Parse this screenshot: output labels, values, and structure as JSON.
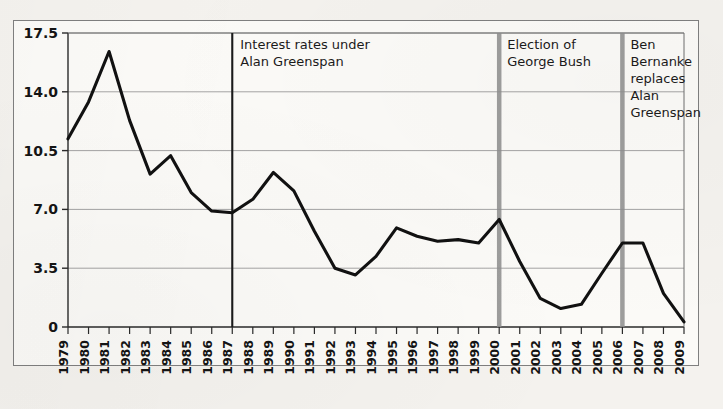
{
  "figure": {
    "background_color": "#fbfaf7",
    "page_color": "#f4f2ee",
    "frame_color": "#7f7f7f"
  },
  "chart_data": {
    "type": "line",
    "title": "",
    "subtitle": "",
    "xlabel": "",
    "ylabel": "",
    "xlim": [
      1979,
      2009
    ],
    "ylim": [
      0,
      17.5
    ],
    "grid": true,
    "legend_position": "none",
    "line_color": "#111111",
    "y_ticks": [
      0,
      3.5,
      7.0,
      10.5,
      14.0,
      17.5
    ],
    "y_tick_labels": [
      "0",
      "3.5",
      "7.0",
      "10.5",
      "14.0",
      "17.5"
    ],
    "categories": [
      "1979",
      "1980",
      "1981",
      "1982",
      "1983",
      "1984",
      "1985",
      "1986",
      "1987",
      "1988",
      "1989",
      "1990",
      "1991",
      "1992",
      "1993",
      "1994",
      "1995",
      "1996",
      "1997",
      "1998",
      "1999",
      "2000",
      "2001",
      "2002",
      "2003",
      "2004",
      "2005",
      "2006",
      "2007",
      "2008",
      "2009"
    ],
    "series": [
      {
        "name": "Interest rate",
        "values": [
          11.2,
          13.4,
          16.4,
          12.3,
          9.1,
          10.2,
          8.0,
          6.9,
          6.8,
          7.6,
          9.2,
          8.1,
          5.7,
          3.5,
          3.1,
          4.2,
          5.9,
          5.4,
          5.1,
          5.2,
          5.0,
          6.4,
          3.9,
          1.7,
          1.1,
          1.35,
          3.2,
          5.0,
          5.0,
          2.0,
          0.3
        ]
      }
    ],
    "annotations": [
      {
        "name": "greenspan-appointment",
        "at_year": "1987",
        "line_style": "solid-black",
        "line_color": "#1a1a1a",
        "lines": [
          "Interest rates under",
          "Alan Greenspan"
        ]
      },
      {
        "name": "bush-election",
        "at_year": "2000",
        "line_style": "solid-gray",
        "line_color": "#8d8d8d",
        "lines": [
          "Election of",
          "George Bush"
        ]
      },
      {
        "name": "bernanke-appointment",
        "at_year": "2006",
        "line_style": "solid-gray",
        "line_color": "#8d8d8d",
        "lines": [
          "Ben",
          "Bernanke",
          "replaces",
          "Alan",
          "Greenspan"
        ]
      }
    ]
  }
}
